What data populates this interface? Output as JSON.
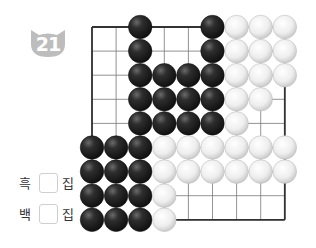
{
  "problem": {
    "number": "21",
    "badge_color": "#bdbdbd"
  },
  "answer_fields": [
    {
      "color_label": "흑",
      "unit": "집",
      "value": ""
    },
    {
      "color_label": "백",
      "unit": "집",
      "value": ""
    }
  ],
  "board": {
    "origin_x": 92,
    "origin_y": 27,
    "spacing": 24.1,
    "cols": 9,
    "rows": 9,
    "line_color": "#777777",
    "border_color": "#333333",
    "stones": {
      "black": [
        [
          2,
          0
        ],
        [
          5,
          0
        ],
        [
          2,
          1
        ],
        [
          5,
          1
        ],
        [
          2,
          2
        ],
        [
          3,
          2
        ],
        [
          4,
          2
        ],
        [
          5,
          2
        ],
        [
          2,
          3
        ],
        [
          3,
          3
        ],
        [
          4,
          3
        ],
        [
          5,
          3
        ],
        [
          2,
          4
        ],
        [
          3,
          4
        ],
        [
          4,
          4
        ],
        [
          5,
          4
        ],
        [
          0,
          5
        ],
        [
          1,
          5
        ],
        [
          2,
          5
        ],
        [
          0,
          6
        ],
        [
          1,
          6
        ],
        [
          2,
          6
        ],
        [
          0,
          7
        ],
        [
          1,
          7
        ],
        [
          2,
          7
        ],
        [
          0,
          8
        ],
        [
          1,
          8
        ],
        [
          2,
          8
        ]
      ],
      "white": [
        [
          6,
          0
        ],
        [
          7,
          0
        ],
        [
          8,
          0
        ],
        [
          6,
          1
        ],
        [
          7,
          1
        ],
        [
          8,
          1
        ],
        [
          6,
          2
        ],
        [
          7,
          2
        ],
        [
          8,
          2
        ],
        [
          6,
          3
        ],
        [
          7,
          3
        ],
        [
          6,
          4
        ],
        [
          3,
          5
        ],
        [
          4,
          5
        ],
        [
          5,
          5
        ],
        [
          6,
          5
        ],
        [
          7,
          5
        ],
        [
          8,
          5
        ],
        [
          3,
          6
        ],
        [
          4,
          6
        ],
        [
          5,
          6
        ],
        [
          6,
          6
        ],
        [
          7,
          6
        ],
        [
          8,
          6
        ],
        [
          3,
          7
        ],
        [
          3,
          8
        ]
      ]
    }
  }
}
